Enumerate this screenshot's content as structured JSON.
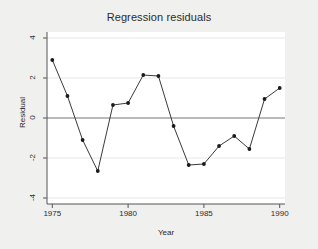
{
  "chart_data": {
    "type": "line",
    "title": "Regression residuals",
    "xlabel": "Year",
    "ylabel": "Residual",
    "x": [
      1975,
      1976,
      1977,
      1978,
      1979,
      1980,
      1981,
      1982,
      1983,
      1984,
      1985,
      1986,
      1987,
      1988,
      1989,
      1990
    ],
    "values": [
      2.9,
      1.1,
      -1.1,
      -2.65,
      0.65,
      0.75,
      2.15,
      2.1,
      -0.4,
      -2.35,
      -2.3,
      -1.4,
      -0.9,
      -1.55,
      0.95,
      1.5
    ],
    "series": [
      {
        "name": "Residual",
        "values": [
          2.9,
          1.1,
          -1.1,
          -2.65,
          0.65,
          0.75,
          2.15,
          2.1,
          -0.4,
          -2.35,
          -2.3,
          -1.4,
          -0.9,
          -1.55,
          0.95,
          1.5
        ]
      }
    ],
    "xlim": [
      1974.65,
      1990.35
    ],
    "ylim": [
      -4.3,
      4.3
    ],
    "xticks": [
      1975,
      1980,
      1985,
      1990
    ],
    "xtick_labels": [
      "1975",
      "1980",
      "1985",
      "1990"
    ],
    "yticks": [
      4,
      2,
      0,
      -2,
      -4
    ],
    "ytick_labels": [
      "4",
      "2",
      "0",
      "-2",
      "-4"
    ],
    "grid": true,
    "grid_axis": "y",
    "legend": false,
    "reference_line": 0,
    "marker": "filled-circle",
    "line_color": "#3a3a3a",
    "marker_color": "#1a1a1a",
    "grid_color": "#e8e8e8",
    "reference_line_color": "#808080",
    "plot_background": "#ffffff",
    "figure_background": "#f0f0ef"
  }
}
